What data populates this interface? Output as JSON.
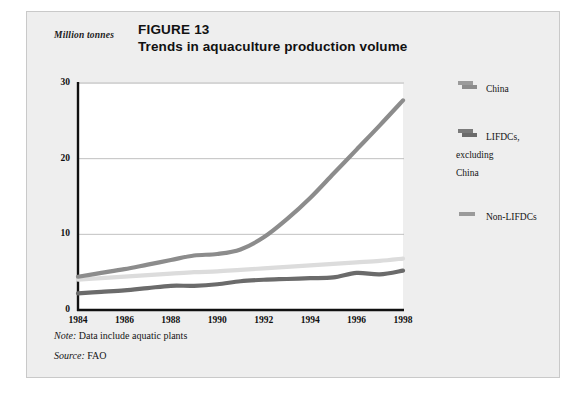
{
  "figure": {
    "number_label": "FIGURE 13",
    "title": "Trends in aquaculture production volume",
    "unit_label": "Million tonnes",
    "note_prefix": "Note:",
    "note_text": " Data include aquatic plants",
    "source_prefix": "Source:",
    "source_text": " FAO"
  },
  "legend": {
    "items": [
      {
        "label": "China",
        "color": "#8c8c8c",
        "name": "legend-item-china"
      },
      {
        "label_line1": "LIFDCs,",
        "label_line2": "excluding",
        "label_line3": "China",
        "color": "#6b6b6b",
        "name": "legend-item-lifdcs"
      },
      {
        "label": "Non-LIFDCs",
        "color": "#9a9a9a",
        "name": "legend-item-non-lifdcs"
      }
    ]
  },
  "colors": {
    "card_background": "#eeeeee",
    "plot_background": "#ffffff",
    "axis": "#101010",
    "gridline": "#b0b0b0",
    "china_line": "#8c8c8c",
    "lifdcs_line": "#6b6b6b",
    "non_lifdcs_line": "#dcdcdc"
  },
  "axes": {
    "y_ticks": [
      "0",
      "10",
      "20",
      "30"
    ],
    "x_ticks": [
      "1984",
      "1986",
      "1988",
      "1990",
      "1992",
      "1994",
      "1996",
      "1998"
    ]
  },
  "chart_data": {
    "type": "line",
    "title": "Trends in aquaculture production volume",
    "subtitle": "FIGURE 13",
    "xlabel": "",
    "ylabel": "Million tonnes",
    "ylim": [
      0,
      30
    ],
    "xlim": [
      1984,
      1998
    ],
    "yticks": [
      0,
      10,
      20,
      30
    ],
    "xticks": [
      1984,
      1986,
      1988,
      1990,
      1992,
      1994,
      1996,
      1998
    ],
    "grid": "horizontal",
    "legend_position": "right",
    "note": "Data include aquatic plants",
    "source": "FAO",
    "x": [
      1984,
      1985,
      1986,
      1987,
      1988,
      1989,
      1990,
      1991,
      1992,
      1993,
      1994,
      1995,
      1996,
      1997,
      1998
    ],
    "series": [
      {
        "name": "China",
        "color": "#8c8c8c",
        "values": [
          4.4,
          4.9,
          5.4,
          6.0,
          6.6,
          7.2,
          7.4,
          8.0,
          9.6,
          12.0,
          14.8,
          18.0,
          21.2,
          24.4,
          27.7
        ]
      },
      {
        "name": "LIFDCs, excluding China",
        "color": "#6b6b6b",
        "values": [
          2.2,
          2.4,
          2.6,
          2.9,
          3.2,
          3.2,
          3.4,
          3.8,
          4.0,
          4.1,
          4.2,
          4.3,
          4.9,
          4.7,
          5.2
        ]
      },
      {
        "name": "Non-LIFDCs",
        "color": "#dcdcdc",
        "values": [
          4.0,
          4.2,
          4.4,
          4.6,
          4.8,
          5.0,
          5.1,
          5.3,
          5.5,
          5.7,
          5.9,
          6.1,
          6.3,
          6.5,
          6.8
        ]
      }
    ]
  }
}
